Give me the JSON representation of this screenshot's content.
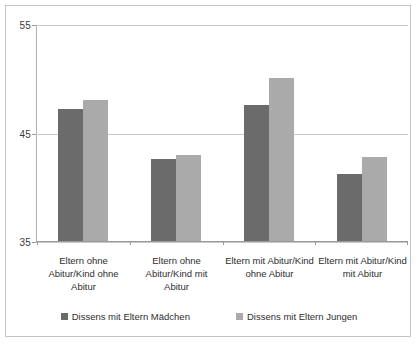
{
  "chart_data": {
    "type": "bar",
    "title": "",
    "subtitle": "",
    "xlabel": "",
    "ylabel": "",
    "ylim": [
      35,
      55
    ],
    "yticks": [
      35,
      45,
      55
    ],
    "ytick_labels": [
      "35",
      "45",
      "55"
    ],
    "grid": true,
    "legend_position": "bottom",
    "categories": [
      "Eltern ohne Abitur/Kind ohne Abitur",
      "Eltern ohne Abitur/Kind mit Abitur",
      "Eltern mit Abitur/Kind ohne Abitur",
      "Eltern mit Abitur/Kind mit Abitur"
    ],
    "category_lines": [
      [
        "Eltern ohne",
        "Abitur/Kind ohne",
        "Abitur"
      ],
      [
        "Eltern ohne",
        "Abitur/Kind mit",
        "Abitur"
      ],
      [
        "Eltern mit Abitur/Kind",
        "ohne Abitur"
      ],
      [
        "Eltern mit Abitur/Kind",
        "mit Abitur"
      ]
    ],
    "series": [
      {
        "name": "Dissens mit Eltern Mädchen",
        "color": "#6b6b6b",
        "values": [
          47.2,
          42.6,
          47.6,
          41.2
        ]
      },
      {
        "name": "Dissens mit Eltern Jungen",
        "color": "#aaaaaa",
        "values": [
          48.1,
          43.0,
          50.1,
          42.8
        ]
      }
    ]
  },
  "legend": {
    "items": [
      {
        "label": "Dissens mit Eltern Mädchen",
        "color": "#6b6b6b"
      },
      {
        "label": "Dissens mit Eltern Jungen",
        "color": "#aaaaaa"
      }
    ]
  },
  "axis": {
    "y_labels": [
      "55",
      "45",
      "35"
    ]
  },
  "colors": {
    "series_dark": "#6b6b6b",
    "series_light": "#aaaaaa",
    "gridline": "#c9c9c9",
    "border": "#c4c4c4",
    "text": "#2e2e2e"
  }
}
